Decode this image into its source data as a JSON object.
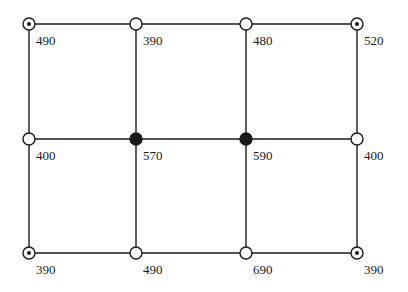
{
  "diagram": {
    "type": "grid-network",
    "columns_x": [
      29,
      136,
      246,
      357
    ],
    "rows_y": [
      24,
      139,
      253
    ],
    "line_color": "#1a1a1a",
    "node_radius": 6,
    "nodes": [
      {
        "id": "r0c0",
        "row": 0,
        "col": 0,
        "style": "dotted",
        "value": "490"
      },
      {
        "id": "r0c1",
        "row": 0,
        "col": 1,
        "style": "open",
        "value": "390"
      },
      {
        "id": "r0c2",
        "row": 0,
        "col": 2,
        "style": "open",
        "value": "480"
      },
      {
        "id": "r0c3",
        "row": 0,
        "col": 3,
        "style": "dotted",
        "value": "520"
      },
      {
        "id": "r1c0",
        "row": 1,
        "col": 0,
        "style": "open",
        "value": "400"
      },
      {
        "id": "r1c1",
        "row": 1,
        "col": 1,
        "style": "filled",
        "value": "570"
      },
      {
        "id": "r1c2",
        "row": 1,
        "col": 2,
        "style": "filled",
        "value": "590"
      },
      {
        "id": "r1c3",
        "row": 1,
        "col": 3,
        "style": "open",
        "value": "400"
      },
      {
        "id": "r2c0",
        "row": 2,
        "col": 0,
        "style": "dotted",
        "value": "390"
      },
      {
        "id": "r2c1",
        "row": 2,
        "col": 1,
        "style": "open",
        "value": "490"
      },
      {
        "id": "r2c2",
        "row": 2,
        "col": 2,
        "style": "open",
        "value": "690"
      },
      {
        "id": "r2c3",
        "row": 2,
        "col": 3,
        "style": "dotted",
        "value": "390"
      }
    ],
    "legend_styles": {
      "open": "open circle",
      "filled": "filled circle",
      "dotted": "circle with center dot"
    }
  }
}
